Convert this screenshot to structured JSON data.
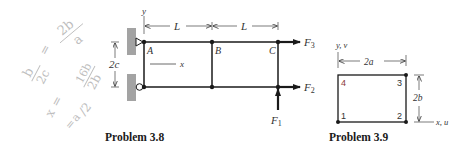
{
  "problem_3_8": {
    "caption": "Problem 3.8",
    "axis_y": "y",
    "axis_x": "x",
    "dim_left": "L",
    "dim_right": "L",
    "dim_vertical": "2c",
    "nodes": {
      "a": "A",
      "b": "B",
      "c": "C"
    },
    "forces": {
      "f1": {
        "base": "F",
        "sub": "1"
      },
      "f2": {
        "base": "F",
        "sub": "2"
      },
      "f3": {
        "base": "F",
        "sub": "3"
      }
    }
  },
  "problem_3_9": {
    "caption": "Problem 3.9",
    "axis_y": "y, v",
    "axis_x": "x, u",
    "dim_width": "2a",
    "dim_height": "2b",
    "corners": {
      "n1": "1",
      "n2": "2",
      "n3": "3",
      "n4": "4"
    }
  },
  "handwriting": {
    "line1": "b/2c = 2b/a",
    "line2": "x = 16b/2b",
    "line3": "= a/2"
  },
  "colors": {
    "line": "#1a1a1a",
    "wall": "#9a9a9a",
    "handwriting": "#bdbdbd",
    "corner4": "#8a3a3a"
  }
}
